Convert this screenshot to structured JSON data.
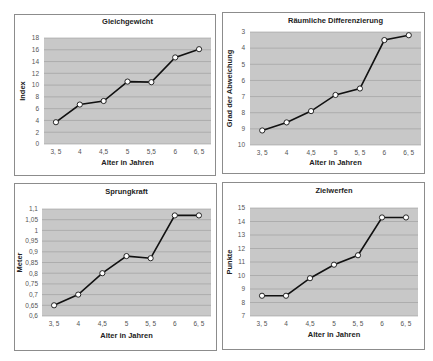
{
  "chart_data": [
    {
      "type": "line",
      "title": "Gleichgewicht",
      "xlabel": "Alter in Jahren",
      "ylabel": "Index",
      "categories": [
        "3, 5",
        "4",
        "4,5",
        "5",
        "5,5",
        "6",
        "6, 5"
      ],
      "values": [
        3.7,
        6.7,
        7.3,
        10.6,
        10.5,
        14.7,
        16.1
      ],
      "ylim": [
        0,
        18
      ],
      "yticks": [
        "0",
        "2",
        "4",
        "6",
        "8",
        "10",
        "12",
        "14",
        "16",
        "18"
      ],
      "y_inverted": false,
      "grid": true,
      "legend": null
    },
    {
      "type": "line",
      "title": "Räumliche Differenzierung",
      "xlabel": "Alter in Jahren",
      "ylabel": "Grad der Abweichung",
      "categories": [
        "3, 5",
        "4",
        "4,5",
        "5",
        "5, 5",
        "6",
        "6, 5"
      ],
      "values": [
        9.1,
        8.6,
        7.9,
        6.9,
        6.5,
        3.5,
        3.2
      ],
      "ylim": [
        3,
        10
      ],
      "yticks": [
        "3",
        "4",
        "5",
        "6",
        "7",
        "8",
        "9",
        "10"
      ],
      "y_inverted": true,
      "grid": true,
      "legend": null
    },
    {
      "type": "line",
      "title": "Sprungkraft",
      "xlabel": "Alter in Jahren",
      "ylabel": "Meter",
      "categories": [
        "3, 5",
        "4",
        "4,5",
        "5",
        "5, 5",
        "6",
        "6, 5"
      ],
      "values": [
        0.65,
        0.7,
        0.8,
        0.88,
        0.87,
        1.07,
        1.07
      ],
      "ylim": [
        0.6,
        1.1
      ],
      "yticks": [
        "0,6",
        "0,65",
        "0,7",
        "0,75",
        "0,8",
        "0,85",
        "0,9",
        "0,95",
        "1",
        "1,05",
        "1,1"
      ],
      "y_inverted": false,
      "grid": true,
      "legend": null
    },
    {
      "type": "line",
      "title": "Zielwerfen",
      "xlabel": "Alter in Jahren",
      "ylabel": "Punkte",
      "categories": [
        "3, 5",
        "4",
        "4,5",
        "5",
        "5, 5",
        "6",
        "6, 5"
      ],
      "values": [
        8.5,
        8.5,
        9.8,
        10.8,
        11.5,
        14.3,
        14.3
      ],
      "ylim": [
        7,
        15
      ],
      "yticks": [
        "7",
        "8",
        "9",
        "10",
        "11",
        "12",
        "13",
        "14",
        "15"
      ],
      "y_inverted": false,
      "grid": true,
      "legend": null
    }
  ],
  "colors": {
    "plot_bg": "#c8c8c8",
    "grid": "#9a9a9a",
    "line": "#111111",
    "marker_fill": "#ffffff",
    "frame": "#8c8c8c"
  }
}
